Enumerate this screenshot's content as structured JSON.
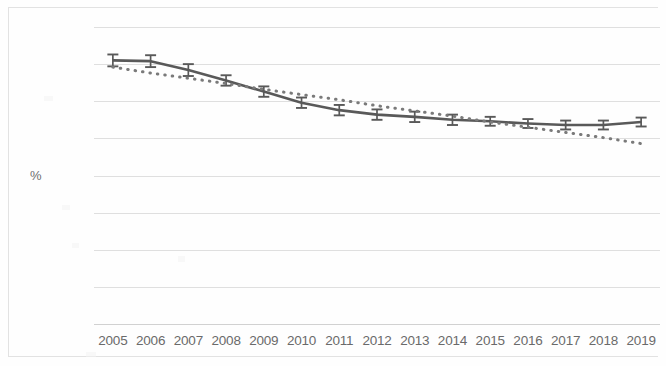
{
  "chart_data": {
    "type": "line",
    "title": "",
    "subtitle": "",
    "xlabel": "",
    "ylabel": "%",
    "ylim": [
      0,
      4
    ],
    "ytick_labels": [
      "4",
      "3.5",
      "3",
      "2.5",
      "2",
      "1.5",
      "1",
      "0.5",
      "0"
    ],
    "ytick_values": [
      4,
      3.5,
      3,
      2.5,
      2,
      1.5,
      1,
      0.5,
      0
    ],
    "grid": true,
    "legend": "none",
    "categories": [
      "2005",
      "2006",
      "2007",
      "2008",
      "2009",
      "2010",
      "2011",
      "2012",
      "2013",
      "2014",
      "2015",
      "2016",
      "2017",
      "2018",
      "2019"
    ],
    "series": [
      {
        "name": "rate",
        "style": "solid-line-with-error-bars",
        "color": "#595959",
        "values": [
          3.55,
          3.54,
          3.42,
          3.28,
          3.13,
          2.98,
          2.88,
          2.82,
          2.79,
          2.75,
          2.73,
          2.7,
          2.68,
          2.68,
          2.72
        ],
        "error_upper": [
          0.08,
          0.08,
          0.08,
          0.07,
          0.07,
          0.07,
          0.07,
          0.07,
          0.07,
          0.07,
          0.06,
          0.06,
          0.06,
          0.06,
          0.06
        ],
        "error_lower": [
          0.08,
          0.08,
          0.08,
          0.07,
          0.07,
          0.07,
          0.07,
          0.07,
          0.07,
          0.07,
          0.06,
          0.06,
          0.06,
          0.06,
          0.06
        ]
      },
      {
        "name": "trendline",
        "style": "dotted-line",
        "color": "#7a7a7a",
        "values": [
          3.46,
          3.38,
          3.31,
          3.24,
          3.16,
          3.09,
          3.02,
          2.94,
          2.87,
          2.8,
          2.72,
          2.65,
          2.58,
          2.51,
          2.43
        ]
      }
    ]
  }
}
